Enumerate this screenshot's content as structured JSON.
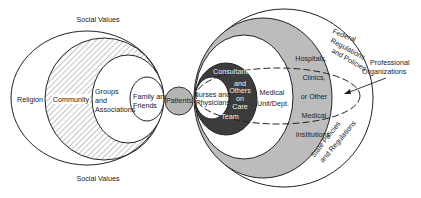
{
  "diagram": {
    "type": "nested-ellipses",
    "left_cluster": {
      "top_label": "Social Values",
      "bottom_label": "Social Values",
      "rings": [
        {
          "id": "religion",
          "label": "Religion",
          "fill": "#ffffff",
          "pattern": "none"
        },
        {
          "id": "community",
          "label": "Community",
          "fill": "#ffffff",
          "pattern": "diagonal-hatch"
        },
        {
          "id": "groups",
          "label_lines": [
            "Groups",
            "and",
            "Associations"
          ],
          "fill": "#ffffff",
          "pattern": "none"
        },
        {
          "id": "family",
          "label_lines": [
            "Family and",
            "Friends"
          ],
          "fill": "#ffffff",
          "pattern": "none"
        }
      ]
    },
    "center": {
      "id": "patients",
      "label": "Patients",
      "fill": "#b5b5b5"
    },
    "right_cluster": {
      "rings": [
        {
          "id": "federal",
          "label_lines": [
            "Federal",
            "Regulations",
            "and Policies"
          ],
          "fill": "#ffffff"
        },
        {
          "id": "state",
          "label_lines": [
            "State Policies",
            "and Regulations"
          ],
          "fill": "#ffffff"
        },
        {
          "id": "institutions",
          "label_lines": [
            "Hospitals,",
            "Clinics,",
            "or Other",
            "Medical",
            "Institutions"
          ],
          "fill": "#b9b9b9"
        },
        {
          "id": "unit",
          "label_lines": [
            "Medical",
            "Unit/Dept."
          ],
          "fill": "#ffffff"
        },
        {
          "id": "team",
          "label_lines": [
            "Consultants",
            "and",
            "Others",
            "on",
            "Care",
            "Team"
          ],
          "fill": "#3a3a3a"
        },
        {
          "id": "nurses",
          "label_lines": [
            "Nurses and",
            "Physicians"
          ],
          "fill": "#ffffff"
        }
      ],
      "overlay": {
        "id": "professional-organizations",
        "label_lines": [
          "Professional",
          "Organizations"
        ],
        "style": "dashed-ellipse-with-arrow"
      }
    }
  }
}
